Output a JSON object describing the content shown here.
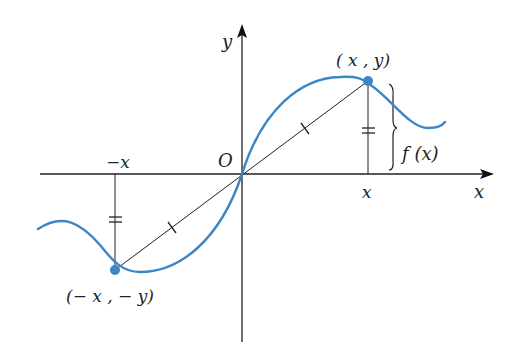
{
  "figure": {
    "labels": {
      "y_axis": "y",
      "x_axis": "x",
      "origin": "O",
      "neg_x_tick": "−x",
      "pos_x_tick": "x",
      "point_positive": "( x , y)",
      "point_negative": "(− x , − y)",
      "brace_label": "f (x)"
    },
    "colors": {
      "curve": "#3d86c6",
      "points": "#3d86c6",
      "axes": "#222222",
      "segments": "#222222",
      "background": "#ffffff"
    },
    "annotations": {
      "vertical_segments_marked_equal": "double tick (=)",
      "chord_halves_marked_equal": "single tick"
    }
  }
}
